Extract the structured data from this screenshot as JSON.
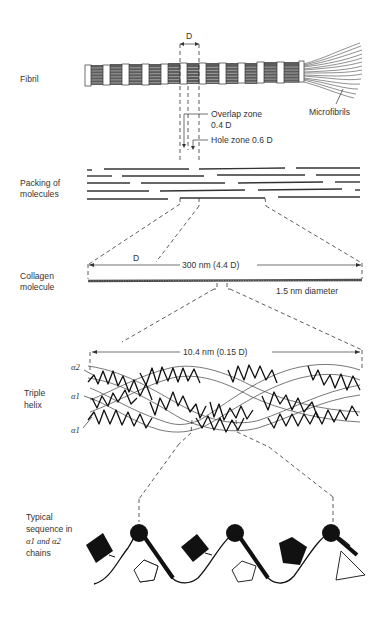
{
  "diagram": {
    "levels": [
      {
        "id": "fibril",
        "label": "Fibril"
      },
      {
        "id": "packing",
        "label_line1": "Packing of",
        "label_line2": "molecules"
      },
      {
        "id": "molecule",
        "label_line1": "Collagen",
        "label_line2": "molecule"
      },
      {
        "id": "helix",
        "label_line1": "Triple",
        "label_line2": "helix"
      },
      {
        "id": "sequence",
        "label_line1": "Typical",
        "label_line2": "sequence in",
        "label_line3": "α1 and α2",
        "label_line4": "chains"
      }
    ],
    "annotations": {
      "period": "D",
      "microfibrils": "Microfibrils",
      "overlap_zone_line1": "Overlap zone",
      "overlap_zone_line2": "0.4 D",
      "hole_zone": "Hole zone 0.6 D",
      "molecule_period": "D",
      "molecule_length": "300 nm (4.4 D)",
      "molecule_diameter": "1.5 nm diameter",
      "helix_pitch": "10.4 nm (0.15 D)",
      "chain_alpha2": "α2",
      "chain_alpha1_a": "α1",
      "chain_alpha1_b": "α1"
    },
    "sequence_residues": [
      "square-filled",
      "glycine",
      "pentagon-open",
      "square-filled",
      "glycine",
      "pentagon-open",
      "pentagon-filled",
      "glycine",
      "triangle-open"
    ],
    "colors": {
      "ink": "#222222",
      "background": "#ffffff",
      "fibril_fill": "#6a6a6a"
    }
  }
}
